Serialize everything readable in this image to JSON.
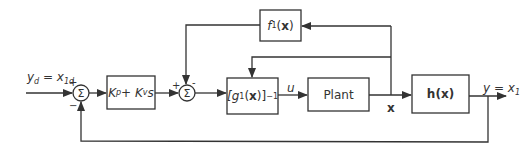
{
  "diagram": {
    "type": "control-block-diagram",
    "colors": {
      "line": "#333333",
      "background": "#ffffff"
    },
    "input": {
      "label": "y_d = x_1d",
      "text_main": "y",
      "text_sub": "d",
      "eq": " = x",
      "eq_sub": "1d"
    },
    "output": {
      "label": "y = x_1",
      "text_main": "y = x",
      "text_sub": "1"
    },
    "summing_junctions": [
      {
        "id": "sum1",
        "symbol": "Σ",
        "signs": {
          "top": "+",
          "bottom": "−"
        }
      },
      {
        "id": "sum2",
        "symbol": "Σ",
        "signs": {
          "left": "+",
          "top": "-"
        }
      }
    ],
    "blocks": [
      {
        "id": "controller",
        "label": "K_p + K_v s",
        "k": "K",
        "p": "p",
        "plus": " + K",
        "v": "v",
        "s": "s"
      },
      {
        "id": "f1",
        "label": "f_1(x)",
        "f": "f",
        "sub": "1",
        "paren_open": "(",
        "x": "x",
        "paren_close": ")"
      },
      {
        "id": "g_inv",
        "label": "[g_1(x)]^-1",
        "open": "[g",
        "sub": "1",
        "mid": "(",
        "x": "x",
        "close": ")]",
        "sup": "−1"
      },
      {
        "id": "plant",
        "label": "Plant"
      },
      {
        "id": "h",
        "label": "h(x)"
      }
    ],
    "signals": {
      "u": "u",
      "x": "x"
    }
  }
}
